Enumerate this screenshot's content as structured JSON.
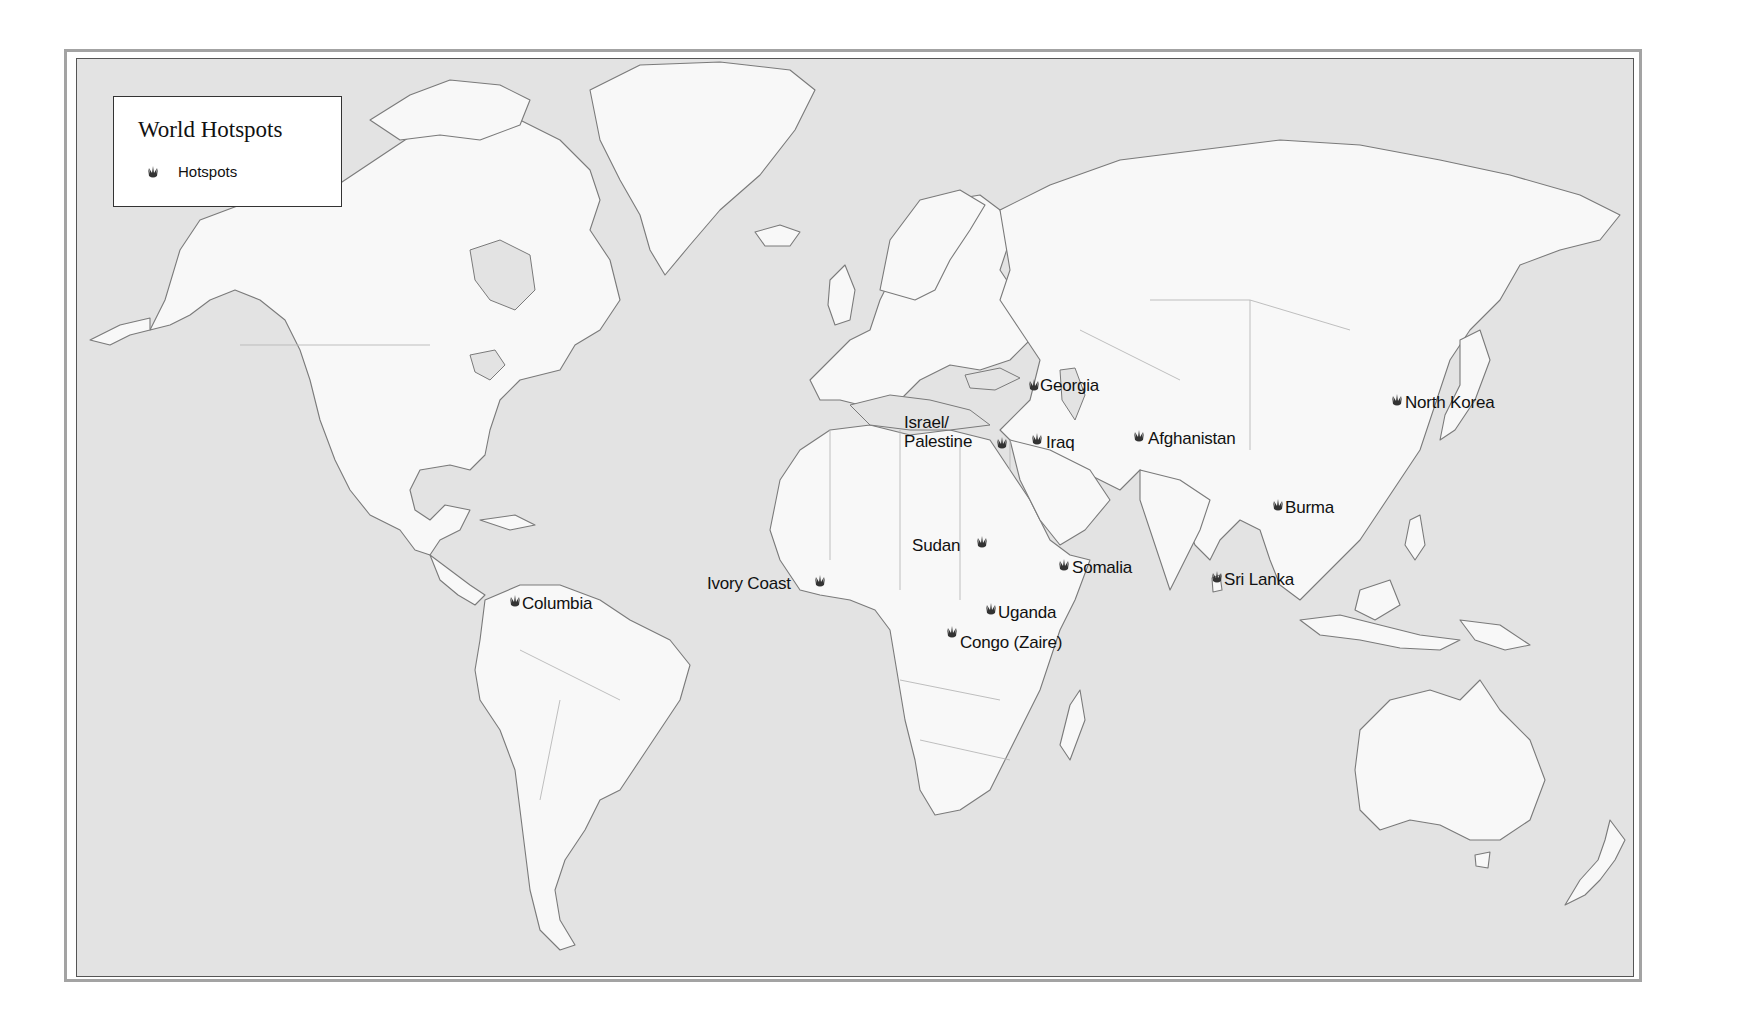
{
  "legend": {
    "title": "World Hotspots",
    "item_label": "Hotspots",
    "item_icon": "hotspot-flame-icon"
  },
  "colors": {
    "ocean": "#e3e3e3",
    "land": "#f8f8f8",
    "coastline": "#7a7a7a",
    "marker": "#333333",
    "frame": "#a3a3a3"
  },
  "hotspots": [
    {
      "name": "Georgia",
      "label": "Georgia",
      "icon_x": 1027,
      "icon_y": 378,
      "label_x": 1040,
      "label_y": 376
    },
    {
      "name": "North Korea",
      "label": "North Korea",
      "icon_x": 1390,
      "icon_y": 393,
      "label_x": 1405,
      "label_y": 393
    },
    {
      "name": "Israel/Palestine",
      "label_line1": "Israel/",
      "label_line2": "Palestine",
      "icon_x": 995,
      "icon_y": 436,
      "label_x": 904,
      "label_y": 413
    },
    {
      "name": "Iraq",
      "label": "Iraq",
      "icon_x": 1030,
      "icon_y": 432,
      "label_x": 1046,
      "label_y": 433
    },
    {
      "name": "Afghanistan",
      "label": "Afghanistan",
      "icon_x": 1132,
      "icon_y": 429,
      "label_x": 1148,
      "label_y": 429
    },
    {
      "name": "Burma",
      "label": "Burma",
      "icon_x": 1271,
      "icon_y": 498,
      "label_x": 1285,
      "label_y": 498
    },
    {
      "name": "Sudan",
      "label": "Sudan",
      "icon_x": 975,
      "icon_y": 535,
      "label_x": 912,
      "label_y": 536
    },
    {
      "name": "Somalia",
      "label": "Somalia",
      "icon_x": 1057,
      "icon_y": 558,
      "label_x": 1072,
      "label_y": 558
    },
    {
      "name": "Sri Lanka",
      "label": "Sri Lanka",
      "icon_x": 1210,
      "icon_y": 570,
      "label_x": 1224,
      "label_y": 570
    },
    {
      "name": "Ivory Coast",
      "label": "Ivory Coast",
      "icon_x": 813,
      "icon_y": 574,
      "label_x": 707,
      "label_y": 574
    },
    {
      "name": "Columbia",
      "label": "Columbia",
      "icon_x": 508,
      "icon_y": 594,
      "label_x": 522,
      "label_y": 594
    },
    {
      "name": "Uganda",
      "label": "Uganda",
      "icon_x": 984,
      "icon_y": 602,
      "label_x": 998,
      "label_y": 603
    },
    {
      "name": "Congo (Zaire)",
      "label": "Congo (Zaire)",
      "icon_x": 945,
      "icon_y": 625,
      "label_x": 960,
      "label_y": 633
    }
  ]
}
